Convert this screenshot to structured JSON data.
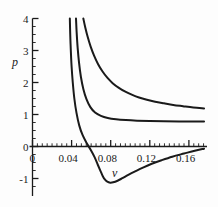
{
  "figure": {
    "background_color": "#fdfdfd",
    "ink_color": "#1a1a1a"
  },
  "chart_data": {
    "type": "line",
    "title": "",
    "xlabel": "v",
    "ylabel": "p",
    "xlim": [
      0,
      0.1775
    ],
    "ylim": [
      -1.45,
      4.0
    ],
    "grid": false,
    "legend": null,
    "xticks": [
      0,
      0.04,
      0.08,
      0.12,
      0.16
    ],
    "xticklabels": [
      "0",
      "0.04",
      "0.08",
      "0.12",
      "0.16"
    ],
    "yticks": [
      -1,
      0,
      1,
      2,
      3,
      4
    ],
    "yticklabels": [
      "-1",
      "0",
      "1",
      "2",
      "3",
      "4"
    ],
    "minor_xtick_step": 0.005,
    "minor_ytick_step": 0.25,
    "series": [
      {
        "name": "upper-isotherm",
        "comment": "supercritical isotherm, monotonic decay",
        "x": [
          0.052,
          0.054,
          0.0565,
          0.0595,
          0.063,
          0.067,
          0.0715,
          0.0765,
          0.082,
          0.088,
          0.0945,
          0.1015,
          0.109,
          0.117,
          0.1255,
          0.1345,
          0.144,
          0.154,
          0.1645,
          0.1755
        ],
        "y": [
          4.0,
          3.72,
          3.42,
          3.12,
          2.84,
          2.58,
          2.35,
          2.15,
          1.98,
          1.84,
          1.72,
          1.62,
          1.53,
          1.46,
          1.4,
          1.35,
          1.3,
          1.26,
          1.22,
          1.19
        ]
      },
      {
        "name": "middle-isotherm",
        "comment": "critical-like isotherm flattening near p = 0.78",
        "x": [
          0.0445,
          0.0452,
          0.0462,
          0.0476,
          0.0495,
          0.052,
          0.0552,
          0.0592,
          0.064,
          0.07,
          0.077,
          0.0855,
          0.0955,
          0.107,
          0.12,
          0.1345,
          0.15,
          0.166,
          0.1755
        ],
        "y": [
          4.0,
          3.55,
          3.08,
          2.62,
          2.18,
          1.8,
          1.48,
          1.23,
          1.06,
          0.955,
          0.89,
          0.85,
          0.825,
          0.808,
          0.797,
          0.789,
          0.784,
          0.781,
          0.78
        ]
      },
      {
        "name": "lower-isotherm-van-der-waals-loop",
        "comment": "subcritical isotherm with minimum near v = 0.082, p = -1.12",
        "x": [
          0.0382,
          0.0386,
          0.0392,
          0.04,
          0.0412,
          0.0428,
          0.045,
          0.0478,
          0.0512,
          0.0552,
          0.0595,
          0.0635,
          0.0668,
          0.0695,
          0.0718,
          0.074,
          0.0765,
          0.0795,
          0.0825,
          0.087,
          0.092,
          0.098,
          0.105,
          0.113,
          0.122,
          0.132,
          0.143,
          0.155,
          0.166,
          0.1755
        ],
        "y": [
          4.0,
          3.5,
          3.0,
          2.5,
          2.0,
          1.5,
          1.05,
          0.66,
          0.36,
          0.12,
          -0.1,
          -0.33,
          -0.57,
          -0.76,
          -0.92,
          -1.03,
          -1.1,
          -1.13,
          -1.12,
          -1.07,
          -0.99,
          -0.89,
          -0.78,
          -0.66,
          -0.54,
          -0.43,
          -0.32,
          -0.22,
          -0.13,
          -0.07
        ]
      }
    ]
  }
}
